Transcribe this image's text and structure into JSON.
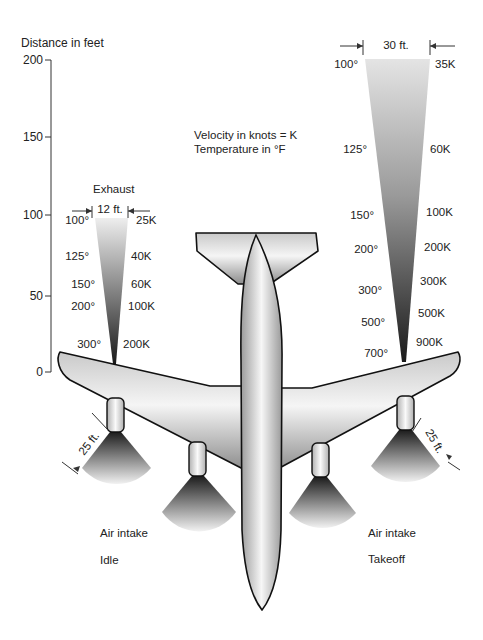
{
  "axis": {
    "title": "Distance in feet",
    "ticks": [
      "200",
      "150",
      "100",
      "50",
      "0"
    ]
  },
  "legend": {
    "line1": "Velocity in knots = K",
    "line2": "Temperature in °F"
  },
  "idle_exhaust": {
    "title": "Exhaust",
    "width_label": "12 ft.",
    "temperatures": [
      "100°",
      "125°",
      "150°",
      "200°",
      "300°"
    ],
    "velocities": [
      "25K",
      "40K",
      "60K",
      "100K",
      "200K"
    ]
  },
  "takeoff_exhaust": {
    "width_label": "30 ft.",
    "temperatures": [
      "100°",
      "125°",
      "150°",
      "200°",
      "300°",
      "500°",
      "700°"
    ],
    "velocities": [
      "35K",
      "60K",
      "100K",
      "200K",
      "300K",
      "500K",
      "900K"
    ]
  },
  "intake": {
    "radius_label_left": "25 ft.",
    "radius_label_right": "25 ft.",
    "left_label": "Air intake",
    "left_mode": "Idle",
    "right_label": "Air intake",
    "right_mode": "Takeoff"
  },
  "colors": {
    "outline": "#111111",
    "plume_light": "#e6e6e6",
    "plume_dark": "#222222",
    "body_light": "#f4f4f4",
    "body_dark": "#8a8a8a"
  }
}
